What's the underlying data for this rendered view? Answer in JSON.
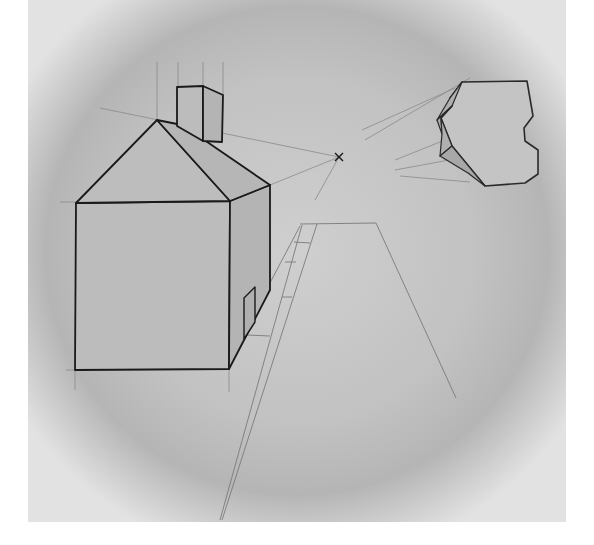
{
  "image": {
    "subject": "One-point perspective pencil drawing",
    "elements": [
      "house",
      "chimney",
      "vanishing-point",
      "road",
      "sidewalk",
      "floating-block"
    ]
  },
  "colors": {
    "paper_light": "#e6e6e6",
    "paper_shadow": "#b8b8b8",
    "fill_gray": "#bcbcbc",
    "ink": "#1a1a1a",
    "guide": "#8a8a8a",
    "border": "#ffffff"
  },
  "vanishing_point": {
    "x": 339,
    "y": 157
  }
}
